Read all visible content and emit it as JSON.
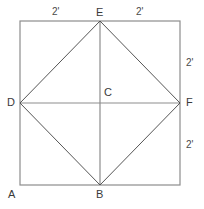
{
  "figure": {
    "colors": {
      "square_outline": "#8d8d8d",
      "axis_line": "#8d8d8d",
      "diagonal_line": "#555555",
      "label_text": "#3a3a3a",
      "background": "#ffffff"
    },
    "square": {
      "left": 20,
      "top": 21,
      "right": 180,
      "bottom": 185,
      "side_feet": 4
    },
    "vertices": [
      {
        "name": "A",
        "label": "A",
        "x": 20,
        "y": 185,
        "label_x": 8,
        "label_y": 189
      },
      {
        "name": "B",
        "label": "B",
        "x": 100,
        "y": 185,
        "label_x": 96,
        "label_y": 189
      },
      {
        "name": "C",
        "label": "C",
        "x": 100,
        "y": 103,
        "label_x": 104,
        "label_y": 87
      },
      {
        "name": "D",
        "label": "D",
        "x": 20,
        "y": 103,
        "label_x": 7,
        "label_y": 97
      },
      {
        "name": "E",
        "label": "E",
        "x": 100,
        "y": 21,
        "label_x": 96,
        "label_y": 7
      },
      {
        "name": "F",
        "label": "F",
        "x": 180,
        "y": 103,
        "label_x": 186,
        "label_y": 97
      }
    ],
    "dimensions": [
      {
        "name": "top-left-segment",
        "label": "2'",
        "x": 52,
        "y": 6,
        "measures": "A-corner to E along top edge"
      },
      {
        "name": "top-right-segment",
        "label": "2'",
        "x": 136,
        "y": 6,
        "measures": "E to top-right corner along top edge"
      },
      {
        "name": "right-upper-segment",
        "label": "2'",
        "x": 186,
        "y": 57,
        "measures": "top-right corner to F along right edge"
      },
      {
        "name": "right-lower-segment",
        "label": "2'",
        "x": 186,
        "y": 139,
        "measures": "F to bottom-right corner along right edge"
      }
    ],
    "segments": [
      {
        "name": "square-outline",
        "kind": "square"
      },
      {
        "name": "line-D-F",
        "kind": "axis",
        "from": "D",
        "to": "F"
      },
      {
        "name": "line-E-B",
        "kind": "axis",
        "from": "E",
        "to": "B"
      },
      {
        "name": "line-D-E",
        "kind": "diagonal",
        "from": "D",
        "to": "E"
      },
      {
        "name": "line-E-F",
        "kind": "diagonal",
        "from": "E",
        "to": "F"
      },
      {
        "name": "line-F-B",
        "kind": "diagonal",
        "from": "F",
        "to": "B"
      },
      {
        "name": "line-B-D",
        "kind": "diagonal",
        "from": "B",
        "to": "D"
      }
    ]
  }
}
